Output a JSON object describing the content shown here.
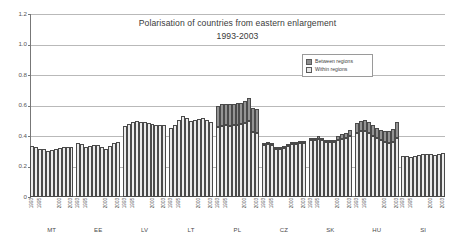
{
  "chart_data": {
    "type": "bar",
    "title": "Polarisation of countries from eastern enlargement",
    "subtitle": "1993-2003",
    "xlabel": "",
    "ylabel": "",
    "ylim": [
      0,
      1.2
    ],
    "yticks": [
      "0",
      "0.2",
      "0.4",
      "0.6",
      "0.8",
      "1.0",
      "1.2"
    ],
    "ytick_values": [
      0,
      0.2,
      0.4,
      0.6,
      0.8,
      1.0,
      1.2
    ],
    "grid": true,
    "stacked": true,
    "legend_position": "upper-right-inside",
    "legend": [
      "Between regions",
      "Within regions"
    ],
    "x": [
      "1993",
      "1994",
      "1995",
      "1996",
      "1997",
      "1998",
      "1999",
      "2000",
      "2001",
      "2002",
      "2003"
    ],
    "visible_xticklabels": [
      "1993",
      "1995",
      "2000",
      "2003"
    ],
    "groups": [
      "MT",
      "EE",
      "LV",
      "LT",
      "PL",
      "CZ",
      "SK",
      "HU",
      "SI"
    ],
    "series": [
      {
        "name": "Within regions",
        "color": "#e9e9e9",
        "data_by_group": {
          "MT": [
            0.335,
            0.325,
            0.313,
            0.312,
            0.303,
            0.308,
            0.316,
            0.322,
            0.326,
            0.33,
            0.329
          ],
          "EE": [
            0.353,
            0.348,
            0.325,
            0.335,
            0.344,
            0.339,
            0.329,
            0.316,
            0.337,
            0.352,
            0.362
          ],
          "LV": [
            0.466,
            0.48,
            0.495,
            0.497,
            0.494,
            0.492,
            0.487,
            0.481,
            0.473,
            0.47,
            0.473
          ],
          "LT": [
            0.452,
            0.475,
            0.508,
            0.531,
            0.515,
            0.496,
            0.503,
            0.512,
            0.516,
            0.503,
            0.49
          ],
          "PL": [
            0.462,
            0.468,
            0.47,
            0.468,
            0.47,
            0.473,
            0.478,
            0.487,
            0.5,
            0.427,
            0.42
          ],
          "CZ": [
            0.341,
            0.348,
            0.338,
            0.318,
            0.312,
            0.322,
            0.337,
            0.345,
            0.347,
            0.352,
            0.351
          ],
          "SK": [
            0.371,
            0.374,
            0.378,
            0.371,
            0.362,
            0.358,
            0.363,
            0.372,
            0.381,
            0.388,
            0.397
          ],
          "HU": [
            0.42,
            0.432,
            0.434,
            0.42,
            0.402,
            0.386,
            0.372,
            0.362,
            0.356,
            0.362,
            0.386
          ],
          "SI": [
            0.268,
            0.266,
            0.264,
            0.268,
            0.273,
            0.281,
            0.284,
            0.279,
            0.276,
            0.281,
            0.29
          ]
        }
      },
      {
        "name": "Between regions",
        "color": "#8b8b8b",
        "data_by_group": {
          "MT": [
            0.0,
            0.0,
            0.0,
            0.0,
            0.0,
            0.0,
            0.0,
            0.0,
            0.0,
            0.0,
            0.0
          ],
          "EE": [
            0.0,
            0.0,
            0.0,
            0.0,
            0.0,
            0.0,
            0.0,
            0.0,
            0.0,
            0.0,
            0.0
          ],
          "LV": [
            0.0,
            0.0,
            0.0,
            0.0,
            0.0,
            0.0,
            0.0,
            0.0,
            0.0,
            0.0,
            0.0
          ],
          "LT": [
            0.0,
            0.0,
            0.0,
            0.0,
            0.0,
            0.0,
            0.0,
            0.0,
            0.0,
            0.0,
            0.0
          ],
          "PL": [
            0.138,
            0.145,
            0.143,
            0.145,
            0.143,
            0.142,
            0.14,
            0.14,
            0.15,
            0.16,
            0.16
          ],
          "CZ": [
            0.01,
            0.009,
            0.008,
            0.004,
            0.003,
            0.004,
            0.013,
            0.014,
            0.013,
            0.012,
            0.011
          ],
          "SK": [
            0.013,
            0.016,
            0.02,
            0.015,
            0.01,
            0.008,
            0.014,
            0.025,
            0.03,
            0.034,
            0.043
          ],
          "HU": [
            0.063,
            0.068,
            0.072,
            0.072,
            0.068,
            0.067,
            0.068,
            0.073,
            0.08,
            0.087,
            0.104
          ],
          "SI": [
            0.0,
            0.0,
            0.0,
            0.0,
            0.0,
            0.0,
            0.0,
            0.0,
            0.0,
            0.0,
            0.0
          ]
        }
      }
    ],
    "totals_by_group": {
      "MT": [
        0.335,
        0.325,
        0.313,
        0.312,
        0.303,
        0.308,
        0.316,
        0.322,
        0.326,
        0.33,
        0.329
      ],
      "EE": [
        0.353,
        0.348,
        0.325,
        0.335,
        0.344,
        0.339,
        0.329,
        0.316,
        0.337,
        0.352,
        0.362
      ],
      "LV": [
        0.466,
        0.48,
        0.495,
        0.497,
        0.494,
        0.492,
        0.487,
        0.481,
        0.473,
        0.47,
        0.473
      ],
      "LT": [
        0.452,
        0.475,
        0.508,
        0.531,
        0.515,
        0.496,
        0.503,
        0.512,
        0.516,
        0.503,
        0.49
      ],
      "PL": [
        0.6,
        0.613,
        0.613,
        0.613,
        0.613,
        0.615,
        0.618,
        0.627,
        0.65,
        0.587,
        0.58
      ],
      "CZ": [
        0.351,
        0.357,
        0.346,
        0.322,
        0.315,
        0.326,
        0.35,
        0.359,
        0.36,
        0.364,
        0.362
      ],
      "SK": [
        0.384,
        0.39,
        0.398,
        0.386,
        0.372,
        0.366,
        0.377,
        0.397,
        0.411,
        0.422,
        0.44
      ],
      "HU": [
        0.483,
        0.5,
        0.506,
        0.492,
        0.47,
        0.453,
        0.44,
        0.435,
        0.436,
        0.449,
        0.49
      ],
      "SI": [
        0.268,
        0.266,
        0.264,
        0.268,
        0.273,
        0.281,
        0.284,
        0.279,
        0.276,
        0.281,
        0.29
      ]
    }
  }
}
